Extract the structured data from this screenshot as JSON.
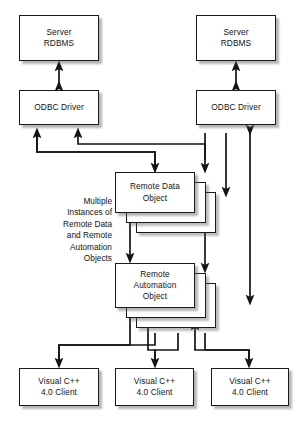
{
  "diagram": {
    "type": "block-architecture-diagram",
    "canvas": {
      "width": 302,
      "height": 425,
      "background": "#ffffff"
    },
    "style": {
      "border_color": "#1a1a1a",
      "fill_color": "#ffffff",
      "shadow_color": "#5a5a5a",
      "text_color": "#141414"
    },
    "nodes": [
      {
        "id": "server-rdbms-left",
        "label": "Server\nRDBMS",
        "x": 19,
        "y": 15,
        "w": 80,
        "h": 46,
        "stack": 1
      },
      {
        "id": "server-rdbms-right",
        "label": "Server\nRDBMS",
        "x": 196,
        "y": 15,
        "w": 80,
        "h": 46,
        "stack": 1
      },
      {
        "id": "odbc-driver-left",
        "label": "ODBC Driver",
        "x": 19,
        "y": 90,
        "w": 80,
        "h": 35,
        "stack": 1
      },
      {
        "id": "odbc-driver-right",
        "label": "ODBC Driver",
        "x": 196,
        "y": 90,
        "w": 80,
        "h": 35,
        "stack": 1
      },
      {
        "id": "remote-data-object",
        "label": "Remote Data\nObject",
        "x": 115,
        "y": 172,
        "w": 80,
        "h": 41,
        "stack": 3
      },
      {
        "id": "remote-automation-object",
        "label": "Remote\nAutomation\nObject",
        "x": 115,
        "y": 263,
        "w": 80,
        "h": 45,
        "stack": 3
      },
      {
        "id": "vc-client-1",
        "label": "Visual C++\n4.0 Client",
        "x": 19,
        "y": 368,
        "w": 80,
        "h": 38,
        "stack": 1
      },
      {
        "id": "vc-client-2",
        "label": "Visual C++\n4.0 Client",
        "x": 115,
        "y": 368,
        "w": 79,
        "h": 38,
        "stack": 1
      },
      {
        "id": "vc-client-3",
        "label": "Visual C++\n4.0 Client",
        "x": 211,
        "y": 368,
        "w": 78,
        "h": 38,
        "stack": 1
      }
    ],
    "annotations": [
      {
        "id": "multiple-instances-note",
        "text": "Multiple\nInstances of\nRemote Data\nand Remote\nAutomation\nObjects",
        "x": 46,
        "y": 196,
        "w": 66,
        "align": "right"
      }
    ],
    "edges": [
      {
        "id": "edge-rdbms-odbc-left",
        "from": "odbc-driver-left",
        "to": "server-rdbms-left",
        "arrow": "both"
      },
      {
        "id": "edge-rdbms-odbc-right",
        "from": "odbc-driver-right",
        "to": "server-rdbms-right",
        "arrow": "both"
      },
      {
        "id": "edge-rdo-odbc-left-a",
        "from": "remote-data-object",
        "to": "odbc-driver-left",
        "arrow": "end"
      },
      {
        "id": "edge-rdo-odbc-left-b",
        "from": "remote-data-object",
        "to": "odbc-driver-left",
        "arrow": "end"
      },
      {
        "id": "edge-odbc-left-to-rdo",
        "from": "odbc-driver-left",
        "to": "remote-data-object",
        "arrow": "end"
      },
      {
        "id": "edge-odbc-right-to-rdo",
        "from": "odbc-driver-right",
        "to": "remote-data-object",
        "arrow": "end"
      },
      {
        "id": "edge-odbc-right-stack",
        "from": "odbc-driver-right",
        "to": "remote-data-object-stack",
        "arrow": "end"
      },
      {
        "id": "edge-odbc-right-rao",
        "from": "odbc-driver-right",
        "to": "remote-automation-object",
        "arrow": "both"
      },
      {
        "id": "edge-rdo-rao",
        "from": "remote-data-object",
        "to": "remote-automation-object",
        "arrow": "both"
      },
      {
        "id": "edge-client1-rao",
        "from": "vc-client-1",
        "to": "remote-automation-object",
        "arrow": "both"
      },
      {
        "id": "edge-client2-rao",
        "from": "vc-client-2",
        "to": "remote-automation-object",
        "arrow": "both"
      },
      {
        "id": "edge-client3-rao",
        "from": "vc-client-3",
        "to": "remote-automation-object",
        "arrow": "both"
      }
    ]
  }
}
